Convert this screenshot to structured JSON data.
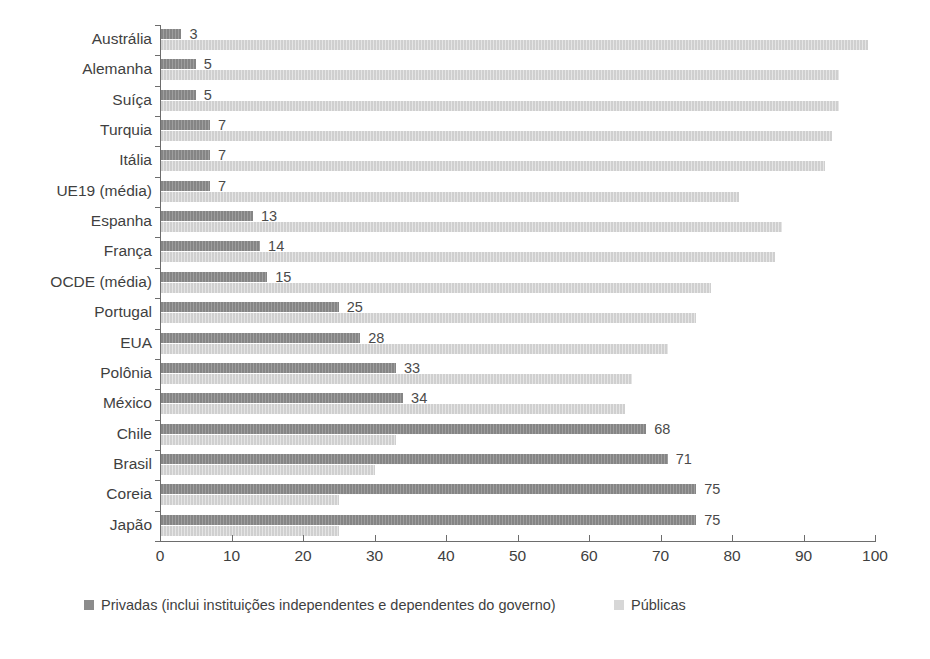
{
  "chart_data": {
    "type": "bar",
    "orientation": "horizontal",
    "title": "",
    "xlabel": "",
    "ylabel": "",
    "xlim": [
      0,
      100
    ],
    "xticks": [
      0,
      10,
      20,
      30,
      40,
      50,
      60,
      70,
      80,
      90,
      100
    ],
    "grid": false,
    "legend_position": "bottom",
    "categories": [
      "Austrália",
      "Alemanha",
      "Suíça",
      "Turquia",
      "Itália",
      "UE19 (média)",
      "Espanha",
      "França",
      "OCDE (média)",
      "Portugal",
      "EUA",
      "Polônia",
      "México",
      "Chile",
      "Brasil",
      "Coreia",
      "Japão"
    ],
    "series": [
      {
        "name": "Privadas (inclui instituições independentes e dependentes do governo)",
        "color": "#8c8c8c",
        "values": [
          3,
          5,
          5,
          7,
          7,
          7,
          13,
          14,
          15,
          25,
          28,
          33,
          34,
          68,
          71,
          75,
          75
        ],
        "labels": [
          "3",
          "5",
          "5",
          "7",
          "7",
          "7",
          "13",
          "14",
          "15",
          "25",
          "28",
          "33",
          "34",
          "68",
          "71",
          "75",
          "75"
        ]
      },
      {
        "name": "Públicas",
        "color": "#d7d7d7",
        "values": [
          99,
          95,
          95,
          94,
          93,
          81,
          87,
          86,
          77,
          75,
          71,
          66,
          65,
          33,
          30,
          25,
          25
        ],
        "labels": [
          "",
          "",
          "",
          "",
          "",
          "",
          "",
          "",
          "",
          "",
          "",
          "",
          "",
          "",
          "",
          "",
          ""
        ]
      }
    ]
  },
  "legend": {
    "private_label": "Privadas (inclui instituições independentes e dependentes do governo)",
    "public_label": "Públicas"
  },
  "axis": {
    "x_tick_labels": [
      "0",
      "10",
      "20",
      "30",
      "40",
      "50",
      "60",
      "70",
      "80",
      "90",
      "100"
    ]
  }
}
